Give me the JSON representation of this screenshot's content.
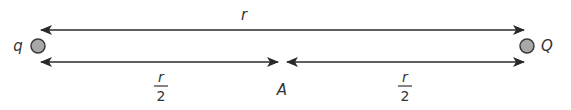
{
  "diagram": {
    "charges": {
      "left": {
        "label": "q",
        "fill": "#a8a8a8",
        "stroke": "#3a3a3a"
      },
      "right": {
        "label": "Q",
        "fill": "#a8a8a8",
        "stroke": "#3a3a3a"
      }
    },
    "top_arrow": {
      "label": "r"
    },
    "left_half": {
      "numerator": "r",
      "denominator": "2"
    },
    "right_half": {
      "numerator": "r",
      "denominator": "2"
    },
    "midpoint": {
      "label": "A"
    },
    "colors": {
      "line": "#2a2a2a",
      "text": "#333333"
    }
  }
}
